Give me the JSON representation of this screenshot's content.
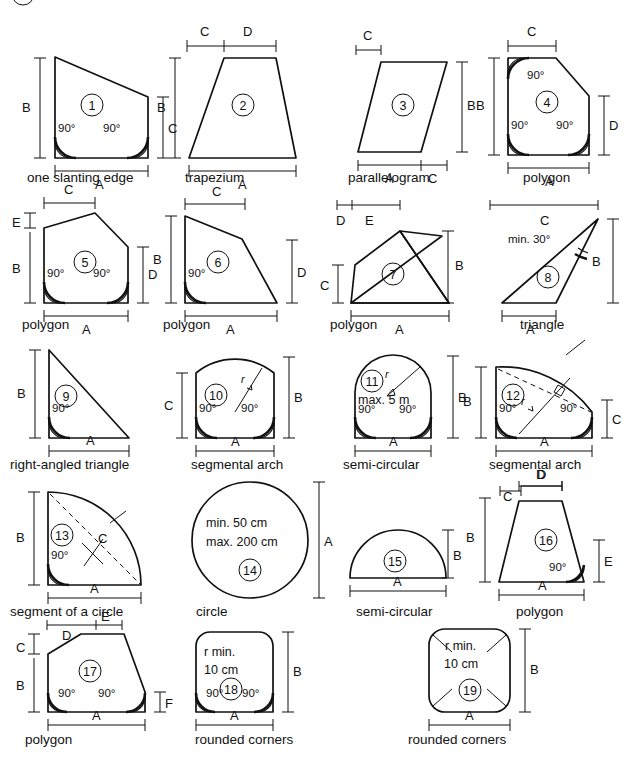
{
  "page": {
    "ink": "#111111",
    "background": "#ffffff"
  },
  "labels": {
    "A": "A",
    "B": "B",
    "C": "C",
    "D": "D",
    "E": "E",
    "F": "F",
    "r": "r",
    "angle90": "90°",
    "min30": "min. 30°",
    "max5m": "max. 5 m",
    "min50cm": "min. 50 cm",
    "max200cm": "max. 200 cm",
    "rmin": "r min.",
    "cm10": "10 cm"
  },
  "figures": [
    {
      "id": "1",
      "number": "1",
      "caption": "one slanting edge",
      "dims": [
        "A",
        "B",
        "C"
      ],
      "angles": [
        "90°",
        "90°"
      ]
    },
    {
      "id": "2",
      "number": "2",
      "caption": "trapezium",
      "dims": [
        "A",
        "B",
        "C",
        "D"
      ],
      "angles": []
    },
    {
      "id": "3",
      "number": "3",
      "caption": "parallelogram",
      "dims": [
        "A",
        "B",
        "C",
        "C"
      ],
      "angles": []
    },
    {
      "id": "4",
      "number": "4",
      "caption": "polygon",
      "dims": [
        "A",
        "B",
        "C",
        "D"
      ],
      "angles": [
        "90°",
        "90°",
        "90°"
      ]
    },
    {
      "id": "5",
      "number": "5",
      "caption": "polygon",
      "dims": [
        "A",
        "B",
        "C",
        "D",
        "E"
      ],
      "angles": [
        "90°",
        "90°"
      ]
    },
    {
      "id": "6",
      "number": "6",
      "caption": "polygon",
      "dims": [
        "A",
        "B",
        "C",
        "D"
      ],
      "angles": [
        "90°"
      ]
    },
    {
      "id": "7",
      "number": "7",
      "caption": "polygon",
      "dims": [
        "A",
        "B",
        "C",
        "D",
        "E"
      ],
      "angles": []
    },
    {
      "id": "8",
      "number": "8",
      "caption": "triangle",
      "dims": [
        "A",
        "B",
        "C"
      ],
      "angles": [
        "min. 30°"
      ]
    },
    {
      "id": "9",
      "number": "9",
      "caption": "right-angled triangle",
      "dims": [
        "A",
        "B"
      ],
      "angles": [
        "90°"
      ]
    },
    {
      "id": "10",
      "number": "10",
      "caption": "segmental arch",
      "dims": [
        "A",
        "B",
        "C",
        "r"
      ],
      "angles": [
        "90°",
        "90°"
      ]
    },
    {
      "id": "11",
      "number": "11",
      "caption": "semi-circular",
      "dims": [
        "A",
        "B",
        "r"
      ],
      "angles": [
        "90°",
        "90°"
      ],
      "note": "max. 5 m"
    },
    {
      "id": "12",
      "number": "12",
      "caption": "segmental arch",
      "dims": [
        "A",
        "B",
        "C",
        "D",
        "r"
      ],
      "angles": [
        "90°",
        "90°"
      ]
    },
    {
      "id": "13",
      "number": "13",
      "caption": "segment of a circle",
      "dims": [
        "A",
        "B",
        "C"
      ],
      "angles": [
        "90°"
      ]
    },
    {
      "id": "14",
      "number": "14",
      "caption": "circle",
      "dims": [
        "A"
      ],
      "angles": [],
      "note": "min. 50 cm / max. 200 cm"
    },
    {
      "id": "15",
      "number": "15",
      "caption": "semi-circular",
      "dims": [
        "A",
        "B"
      ],
      "angles": []
    },
    {
      "id": "16",
      "number": "16",
      "caption": "polygon",
      "dims": [
        "A",
        "B",
        "C",
        "D",
        "E"
      ],
      "angles": [
        "90°"
      ]
    },
    {
      "id": "17",
      "number": "17",
      "caption": "polygon",
      "dims": [
        "A",
        "B",
        "C",
        "D",
        "E",
        "F"
      ],
      "angles": [
        "90°",
        "90°"
      ]
    },
    {
      "id": "18",
      "number": "18",
      "caption": "rounded corners",
      "dims": [
        "A",
        "B"
      ],
      "angles": [
        "90°",
        "90°"
      ],
      "note": "r min. 10 cm"
    },
    {
      "id": "19",
      "number": "19",
      "caption": "rounded corners",
      "dims": [
        "A",
        "B"
      ],
      "angles": [],
      "note": "r min. 10 cm"
    }
  ]
}
